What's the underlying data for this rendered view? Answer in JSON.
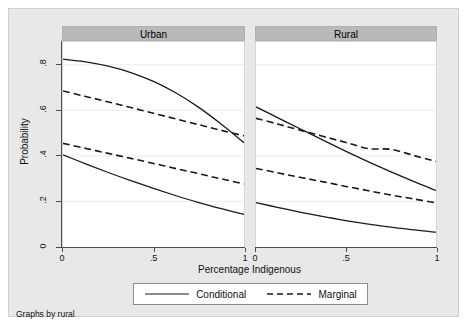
{
  "note": "Graphs by rural",
  "axes": {
    "y_title": "Probability",
    "x_title": "Percentage Indigenous",
    "y_ticks": [
      "0",
      ".2",
      ".4",
      ".6",
      ".8"
    ],
    "x_ticks": [
      "0",
      ".5",
      "1"
    ]
  },
  "panels": [
    {
      "label": "Urban"
    },
    {
      "label": "Rural"
    }
  ],
  "legend": {
    "items": [
      {
        "label": "Conditional",
        "style": "solid"
      },
      {
        "label": "Marginal",
        "style": "dashed"
      }
    ]
  },
  "colors": {
    "line": "#1a1a1a",
    "panel_header": "#b9b9b9",
    "graph_region": "#e8e8e8",
    "plot_background": "#ffffff",
    "grid": "#ececec",
    "axis": "#4d4d4d"
  },
  "chart_data": {
    "type": "line",
    "title": "",
    "xlabel": "Percentage Indigenous",
    "ylabel": "Probability",
    "xlim": [
      0,
      1
    ],
    "ylim": [
      0,
      0.9
    ],
    "xticks": [
      0,
      0.5,
      1
    ],
    "yticks": [
      0,
      0.2,
      0.4,
      0.6,
      0.8
    ],
    "grid": true,
    "legend_position": "bottom",
    "facet_by": "rural",
    "facets": [
      {
        "name": "Urban",
        "x": [
          0,
          0.125,
          0.25,
          0.375,
          0.5,
          0.625,
          0.75,
          0.875,
          1
        ],
        "series": [
          {
            "name": "Conditional (upper)",
            "style": "solid",
            "values": [
              0.825,
              0.813,
              0.794,
              0.766,
              0.727,
              0.676,
              0.613,
              0.539,
              0.458
            ]
          },
          {
            "name": "Marginal (upper)",
            "style": "dashed",
            "values": [
              0.685,
              0.661,
              0.637,
              0.612,
              0.587,
              0.562,
              0.537,
              0.512,
              0.488
            ]
          },
          {
            "name": "Marginal (lower)",
            "style": "dashed",
            "values": [
              0.455,
              0.433,
              0.411,
              0.389,
              0.367,
              0.344,
              0.322,
              0.299,
              0.277
            ]
          },
          {
            "name": "Conditional (lower)",
            "style": "solid",
            "values": [
              0.405,
              0.365,
              0.327,
              0.291,
              0.257,
              0.225,
              0.195,
              0.168,
              0.143
            ]
          }
        ]
      },
      {
        "name": "Rural",
        "x": [
          0,
          0.125,
          0.25,
          0.375,
          0.5,
          0.625,
          0.75,
          0.875,
          1
        ],
        "series": [
          {
            "name": "Conditional (upper)",
            "style": "solid",
            "values": [
              0.615,
              0.566,
              0.517,
              0.468,
              0.42,
              0.374,
              0.33,
              0.288,
              0.248
            ]
          },
          {
            "name": "Marginal (upper)",
            "style": "dashed",
            "values": [
              0.565,
              0.539,
              0.512,
              0.485,
              0.459,
              0.432,
              0.429,
              0.402,
              0.376
            ]
          },
          {
            "name": "Marginal (lower)",
            "style": "dashed",
            "values": [
              0.345,
              0.325,
              0.305,
              0.286,
              0.266,
              0.247,
              0.228,
              0.211,
              0.194
            ]
          },
          {
            "name": "Conditional (lower)",
            "style": "solid",
            "values": [
              0.195,
              0.173,
              0.152,
              0.133,
              0.116,
              0.1,
              0.087,
              0.075,
              0.065
            ]
          }
        ]
      }
    ]
  }
}
